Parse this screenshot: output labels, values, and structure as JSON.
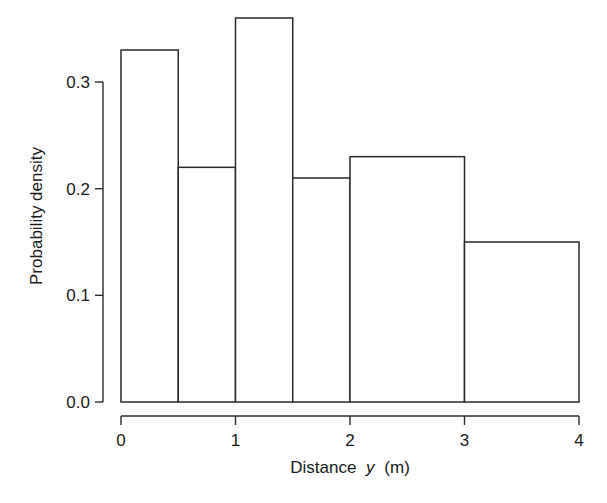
{
  "chart_data": {
    "type": "bar",
    "subtype": "histogram",
    "title": "",
    "xlabel": "Distance",
    "xlabel_var": "y",
    "xlabel_unit": "(m)",
    "ylabel": "Probability density",
    "xlim": [
      0,
      4
    ],
    "ylim": [
      0,
      0.3
    ],
    "x_ticks": [
      0,
      1,
      2,
      3,
      4
    ],
    "x_tick_labels": [
      "0",
      "1",
      "2",
      "3",
      "4"
    ],
    "y_ticks": [
      0.0,
      0.1,
      0.2,
      0.3
    ],
    "y_tick_labels": [
      "0.0",
      "0.1",
      "0.2",
      "0.3"
    ],
    "grid": false,
    "legend": null,
    "bins": [
      {
        "x0": 0.0,
        "x1": 0.5,
        "density": 0.33
      },
      {
        "x0": 0.5,
        "x1": 1.0,
        "density": 0.22
      },
      {
        "x0": 1.0,
        "x1": 1.5,
        "density": 0.36
      },
      {
        "x0": 1.5,
        "x1": 2.0,
        "density": 0.21
      },
      {
        "x0": 2.0,
        "x1": 3.0,
        "density": 0.23
      },
      {
        "x0": 3.0,
        "x1": 4.0,
        "density": 0.15
      }
    ],
    "categories": [
      "0-0.5",
      "0.5-1",
      "1-1.5",
      "1.5-2",
      "2-3",
      "3-4"
    ],
    "values": [
      0.33,
      0.22,
      0.36,
      0.21,
      0.23,
      0.15
    ],
    "colors": {
      "bar_fill": "#ffffff",
      "bar_stroke": "#2a2a2a",
      "axis": "#2a2a2a",
      "text": "#1a1a1a"
    }
  }
}
